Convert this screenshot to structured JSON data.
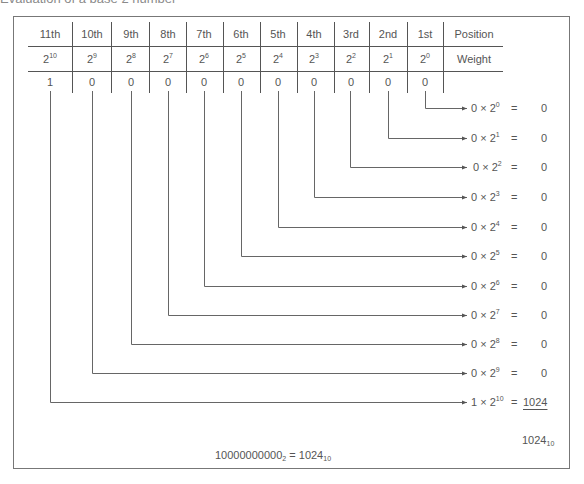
{
  "title": "Evaluation of a base 2 number",
  "table": {
    "row_labels": {
      "position": "Position",
      "weight": "Weight"
    },
    "positions": [
      "11th",
      "10th",
      "9th",
      "8th",
      "7th",
      "6th",
      "5th",
      "4th",
      "3rd",
      "2nd",
      "1st"
    ],
    "weight_base": [
      "2",
      "2",
      "2",
      "2",
      "2",
      "2",
      "2",
      "2",
      "2",
      "2",
      "2"
    ],
    "weight_exp": [
      "10",
      "9",
      "8",
      "7",
      "6",
      "5",
      "4",
      "3",
      "2",
      "1",
      "0"
    ],
    "bits": [
      "1",
      "0",
      "0",
      "0",
      "0",
      "0",
      "0",
      "0",
      "0",
      "0",
      "0"
    ]
  },
  "terms": [
    {
      "bit": "0",
      "times": "×",
      "base": "2",
      "exp": "0",
      "eq": "=",
      "value": "0"
    },
    {
      "bit": "0",
      "times": "×",
      "base": "2",
      "exp": "1",
      "eq": "=",
      "value": "0"
    },
    {
      "bit": "0",
      "times": "×",
      "base": "2",
      "exp": "2",
      "eq": "=",
      "value": "0"
    },
    {
      "bit": "0",
      "times": "×",
      "base": "2",
      "exp": "3",
      "eq": "=",
      "value": "0"
    },
    {
      "bit": "0",
      "times": "×",
      "base": "2",
      "exp": "4",
      "eq": "=",
      "value": "0"
    },
    {
      "bit": "0",
      "times": "×",
      "base": "2",
      "exp": "5",
      "eq": "=",
      "value": "0"
    },
    {
      "bit": "0",
      "times": "×",
      "base": "2",
      "exp": "6",
      "eq": "=",
      "value": "0"
    },
    {
      "bit": "0",
      "times": "×",
      "base": "2",
      "exp": "7",
      "eq": "=",
      "value": "0"
    },
    {
      "bit": "0",
      "times": "×",
      "base": "2",
      "exp": "8",
      "eq": "=",
      "value": "0"
    },
    {
      "bit": "0",
      "times": "×",
      "base": "2",
      "exp": "9",
      "eq": "=",
      "value": "0"
    },
    {
      "bit": "1",
      "times": "×",
      "base": "2",
      "exp": "10",
      "eq": "=",
      "value": "1024"
    }
  ],
  "sum": {
    "value": "1024",
    "base": "10"
  },
  "conclusion": {
    "binary": "10000000000",
    "binary_base": "2",
    "eq": "=",
    "decimal": "1024",
    "decimal_base": "10"
  }
}
